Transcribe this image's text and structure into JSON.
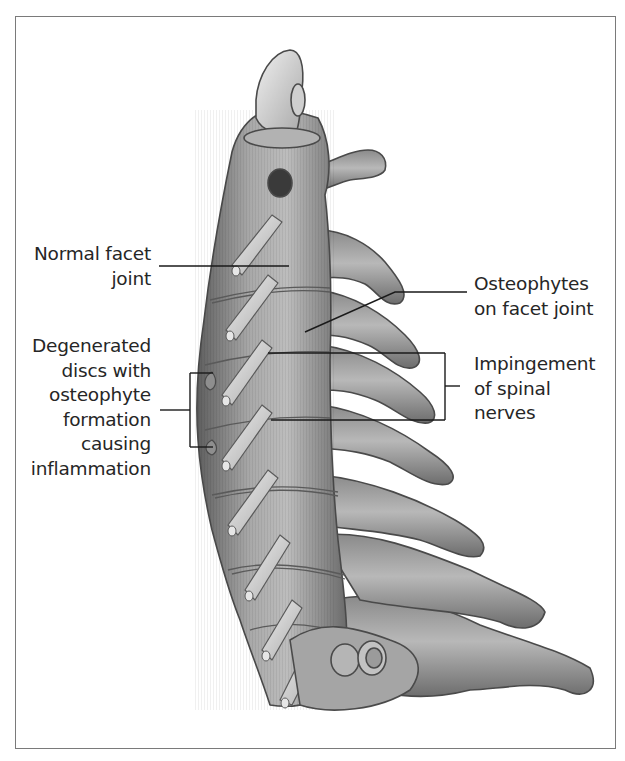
{
  "figure": {
    "colors": {
      "border": "#7a7a7a",
      "bone_fill": "#9a9a9a",
      "bone_light": "#d6d6d6",
      "bone_dark": "#4a4a4a",
      "leader_line": "#1a1a1a",
      "label_text": "#262626",
      "background": "#ffffff"
    }
  },
  "labels": {
    "normal_facet": {
      "lines": [
        "Normal facet",
        "joint"
      ]
    },
    "degenerated": {
      "lines": [
        "Degenerated",
        "discs with",
        "osteophyte",
        "formation",
        "causing",
        "inflammation"
      ]
    },
    "osteophytes": {
      "lines": [
        "Osteophytes",
        "on facet joint"
      ]
    },
    "impingement": {
      "lines": [
        "Impingement",
        "of spinal",
        "nerves"
      ]
    }
  }
}
